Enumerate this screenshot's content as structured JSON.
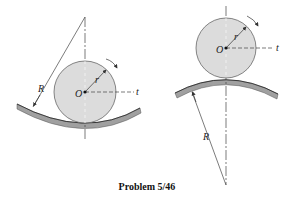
{
  "caption": "Problem 5/46",
  "figures": {
    "left": {
      "description": "Disk rolling inside a concave circular track",
      "labels": {
        "radius_track": "R",
        "radius_disk": "r",
        "center": "O",
        "tangent_axis": "t"
      }
    },
    "right": {
      "description": "Disk rolling on top of a convex circular track",
      "labels": {
        "radius_track": "R",
        "radius_disk": "r",
        "center": "O",
        "tangent_axis": "t"
      }
    }
  },
  "colors": {
    "disk_fill": "#dcdcdc",
    "track_fill": "#9a9a9a",
    "line": "#333333"
  }
}
